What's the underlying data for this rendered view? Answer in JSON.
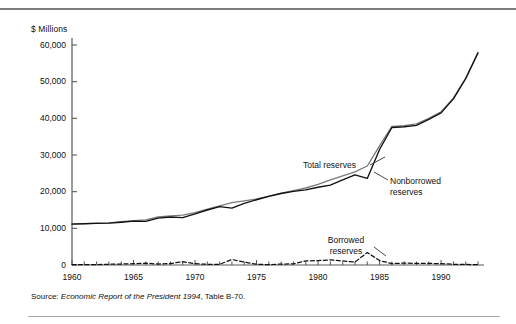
{
  "figure": {
    "unit_label": "$ Millions",
    "source_prefix": "Source:",
    "source_title": "Economic Report of the President 1994",
    "source_suffix": ", Table B-70."
  },
  "chart_data": {
    "type": "line",
    "title": "",
    "xlabel": "",
    "ylabel": "$ Millions",
    "xlim": [
      1960,
      1993
    ],
    "ylim": [
      0,
      60000
    ],
    "grid": false,
    "legend_position": "inline-annotations",
    "y_ticks": [
      0,
      10000,
      20000,
      30000,
      40000,
      50000,
      60000
    ],
    "y_tick_labels": [
      "0",
      "10,000",
      "20,000",
      "30,000",
      "40,000",
      "50,000",
      "60,000"
    ],
    "x_ticks": [
      1960,
      1965,
      1970,
      1975,
      1980,
      1985,
      1990
    ],
    "x_tick_labels": [
      "1960",
      "1965",
      "1970",
      "1975",
      "1980",
      "1985",
      "1990"
    ],
    "x_minor_tick_interval": 1,
    "x": [
      1960,
      1961,
      1962,
      1963,
      1964,
      1965,
      1966,
      1967,
      1968,
      1969,
      1970,
      1971,
      1972,
      1973,
      1974,
      1975,
      1976,
      1977,
      1978,
      1979,
      1980,
      1981,
      1982,
      1983,
      1984,
      1985,
      1986,
      1987,
      1988,
      1989,
      1990,
      1991,
      1992,
      1993
    ],
    "series": [
      {
        "name": "Total reserves",
        "color": "#7a7a7a",
        "style": "solid",
        "values": [
          11200,
          11300,
          11400,
          11500,
          11800,
          12100,
          12300,
          13100,
          13400,
          13600,
          14300,
          15200,
          16100,
          17000,
          17500,
          18000,
          18800,
          19600,
          20300,
          21000,
          22000,
          23200,
          24300,
          25400,
          27000,
          32500,
          37800,
          38000,
          38500,
          40000,
          41800,
          45500,
          51000,
          58000
        ]
      },
      {
        "name": "Nonborrowed reserves",
        "color": "#111111",
        "style": "solid",
        "values": [
          11150,
          11250,
          11350,
          11400,
          11650,
          11950,
          11900,
          12800,
          13100,
          12900,
          13950,
          15000,
          15900,
          15500,
          16800,
          17800,
          18700,
          19500,
          20100,
          20500,
          21200,
          21800,
          23200,
          24600,
          23600,
          31500,
          37500,
          37700,
          38100,
          39700,
          41500,
          45300,
          50800,
          57800
        ]
      },
      {
        "name": "Borrowed reserves",
        "color": "#111111",
        "style": "dashed",
        "values": [
          100,
          120,
          100,
          200,
          250,
          350,
          500,
          250,
          400,
          900,
          350,
          200,
          200,
          1500,
          800,
          200,
          100,
          250,
          300,
          1100,
          1200,
          1400,
          1100,
          800,
          3400,
          1200,
          400,
          500,
          450,
          450,
          350,
          200,
          150,
          100
        ]
      }
    ],
    "annotations": [
      {
        "name": "total-reserves-label",
        "text": "Total reserves",
        "x": 1980.5,
        "y": 24500
      },
      {
        "name": "nonborrowed-reserves-label",
        "text": "Nonborrowed\nreserves",
        "line1": "Nonborrowed",
        "line2": "reserves",
        "x": 1988,
        "y": 22000
      },
      {
        "name": "borrowed-reserves-label",
        "text": "Borrowed\nreserves",
        "line1": "Borrowed",
        "line2": "reserves",
        "x": 1982,
        "y": 6500
      }
    ]
  }
}
